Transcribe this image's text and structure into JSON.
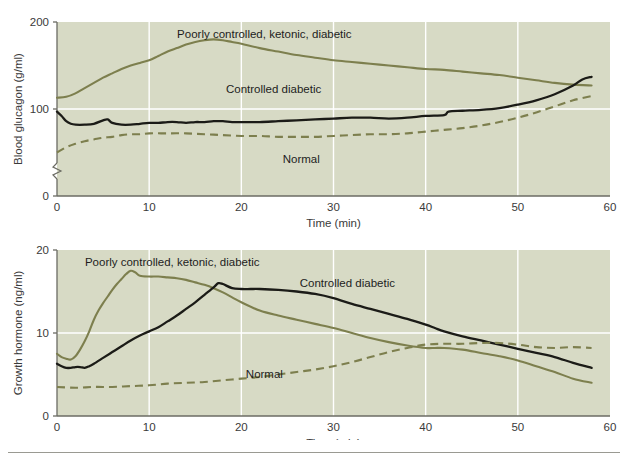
{
  "figure": {
    "caption_rule": "",
    "caption_text": ""
  },
  "chart_data": [
    {
      "id": "blood-glucagon",
      "type": "line",
      "title": "",
      "xlabel": "Time (min)",
      "ylabel": "Blood glucagon (g/ml)",
      "xlim": [
        0,
        60
      ],
      "ylim": [
        0,
        200
      ],
      "xticks": [
        0,
        10,
        20,
        30,
        40,
        50,
        60
      ],
      "xticklabels": [
        "0",
        "10",
        "20",
        "30",
        "40",
        "50",
        "60"
      ],
      "yticks": [
        0,
        100,
        200
      ],
      "yticklabels": [
        "0",
        "100",
        "200"
      ],
      "grid": true,
      "grid_color": "#ffffff",
      "plot_background": "#d7dac5",
      "legend": "inline-annotations",
      "axis_break_y": true,
      "series": [
        {
          "name": "Poorly controlled, ketonic, diabetic",
          "style": "solid",
          "color": "#7d7f4e",
          "label_position": {
            "x": 22.5,
            "y": 182
          },
          "x": [
            0,
            1,
            2,
            3,
            4,
            5,
            6,
            7,
            8,
            9,
            10,
            11,
            12,
            13,
            14,
            15,
            16,
            17,
            18,
            19,
            20,
            22,
            24,
            26,
            28,
            30,
            32,
            34,
            36,
            38,
            40,
            42,
            44,
            46,
            48,
            50,
            52,
            54,
            56,
            58
          ],
          "y": [
            113,
            114,
            118,
            124,
            130,
            136,
            141,
            146,
            150,
            153,
            156,
            161,
            166,
            170,
            174,
            177,
            179,
            180,
            179,
            177,
            175,
            170,
            166,
            162,
            159,
            156,
            154,
            152,
            150,
            148,
            146,
            145,
            143,
            141,
            139,
            136,
            133,
            130,
            128,
            127
          ]
        },
        {
          "name": "Controlled diabetic",
          "style": "solid",
          "color": "#1b1b17",
          "label_position": {
            "x": 23.5,
            "y": 118
          },
          "x": [
            0,
            0.5,
            1,
            1.5,
            2,
            3,
            4,
            5,
            5.5,
            6,
            7,
            8,
            9,
            10,
            11,
            12,
            13,
            14,
            15,
            16,
            17,
            18,
            19,
            20,
            22,
            24,
            26,
            28,
            30,
            32,
            34,
            36,
            38,
            40,
            42,
            42.5,
            44,
            46,
            48,
            50,
            52,
            54,
            56,
            57,
            58
          ],
          "y": [
            97,
            92,
            86,
            83,
            82,
            82,
            83,
            87,
            88,
            84,
            82,
            82,
            83,
            84,
            84,
            85,
            85,
            84,
            85,
            85,
            86,
            86,
            85,
            85,
            85,
            86,
            87,
            88,
            89,
            90,
            90,
            89,
            90,
            92,
            93,
            97,
            98,
            99,
            101,
            105,
            110,
            117,
            127,
            134,
            137
          ]
        },
        {
          "name": "Normal",
          "style": "dashed",
          "color": "#7d7f4e",
          "label_position": {
            "x": 26.5,
            "y": 38
          },
          "x": [
            0,
            1,
            2,
            3,
            4,
            5,
            6,
            7,
            8,
            9,
            10,
            12,
            14,
            16,
            18,
            20,
            22,
            24,
            26,
            28,
            30,
            32,
            34,
            36,
            38,
            40,
            42,
            44,
            46,
            48,
            50,
            52,
            54,
            56,
            58
          ],
          "y": [
            50,
            56,
            60,
            63,
            65,
            67,
            68,
            70,
            71,
            71,
            72,
            72,
            72,
            71,
            70,
            69,
            69,
            68,
            68,
            68,
            69,
            70,
            71,
            71,
            72,
            74,
            76,
            78,
            81,
            85,
            90,
            96,
            103,
            110,
            115
          ]
        }
      ]
    },
    {
      "id": "growth-hormone",
      "type": "line",
      "title": "",
      "xlabel": "Time (min)",
      "ylabel": "Growth hormone (ng/ml)",
      "xlim": [
        0,
        60
      ],
      "ylim": [
        0,
        20
      ],
      "xticks": [
        0,
        10,
        20,
        30,
        40,
        50,
        60
      ],
      "xticklabels": [
        "0",
        "10",
        "20",
        "30",
        "40",
        "50",
        "60"
      ],
      "yticks": [
        0,
        10,
        20
      ],
      "yticklabels": [
        "0",
        "10",
        "20"
      ],
      "grid": true,
      "grid_color": "#ffffff",
      "plot_background": "#d7dac5",
      "legend": "inline-annotations",
      "axis_break_y": false,
      "series": [
        {
          "name": "Poorly controlled, ketonic, diabetic",
          "style": "solid",
          "color": "#7d7f4e",
          "label_position": {
            "x": 12.5,
            "y": 18.1
          },
          "x": [
            0,
            0.5,
            1,
            1.5,
            2,
            2.5,
            3,
            3.5,
            4,
            4.5,
            5,
            5.5,
            6,
            6.5,
            7,
            7.5,
            8,
            8.5,
            9,
            10,
            11,
            12,
            13,
            14,
            15,
            16,
            17,
            18,
            19,
            20,
            22,
            24,
            26,
            28,
            30,
            32,
            34,
            36,
            38,
            40,
            41,
            42,
            44,
            46,
            48,
            50,
            52,
            54,
            56,
            58
          ],
          "y": [
            7.5,
            7.1,
            6.9,
            6.8,
            7.2,
            8.0,
            9.0,
            10.2,
            11.6,
            12.7,
            13.6,
            14.4,
            15.2,
            15.9,
            16.5,
            17.1,
            17.5,
            17.3,
            16.9,
            16.8,
            16.8,
            16.7,
            16.6,
            16.4,
            16.1,
            15.8,
            15.4,
            14.9,
            14.3,
            13.7,
            12.7,
            12.1,
            11.6,
            11.1,
            10.6,
            10.0,
            9.4,
            8.9,
            8.5,
            8.2,
            8.2,
            8.2,
            8.0,
            7.6,
            7.2,
            6.7,
            6.0,
            5.3,
            4.5,
            4.0
          ]
        },
        {
          "name": "Controlled diabetic",
          "style": "solid",
          "color": "#1b1b17",
          "label_position": {
            "x": 31.5,
            "y": 15.6
          },
          "x": [
            0,
            0.5,
            1,
            1.5,
            2,
            2.5,
            3,
            3.5,
            4,
            5,
            6,
            7,
            8,
            9,
            10,
            11,
            12,
            13,
            14,
            15,
            16,
            17,
            17.5,
            18,
            19,
            20,
            21,
            22,
            24,
            26,
            28,
            30,
            32,
            34,
            36,
            38,
            40,
            41,
            42,
            44,
            46,
            48,
            50,
            52,
            54,
            56,
            58
          ],
          "y": [
            6.3,
            6.0,
            5.8,
            5.8,
            5.9,
            5.9,
            5.8,
            6.0,
            6.3,
            7.0,
            7.7,
            8.4,
            9.1,
            9.7,
            10.2,
            10.7,
            11.4,
            12.1,
            12.9,
            13.7,
            14.6,
            15.5,
            16.0,
            15.9,
            15.4,
            15.3,
            15.3,
            15.3,
            15.2,
            15.0,
            14.7,
            14.2,
            13.5,
            12.9,
            12.3,
            11.7,
            11.0,
            10.6,
            10.2,
            9.6,
            9.1,
            8.6,
            8.1,
            7.6,
            7.1,
            6.4,
            5.8
          ]
        },
        {
          "name": "Normal",
          "style": "dashed",
          "color": "#7d7f4e",
          "label_position": {
            "x": 22.5,
            "y": 4.6
          },
          "x": [
            0,
            2,
            4,
            6,
            8,
            10,
            12,
            14,
            16,
            18,
            20,
            22,
            24,
            26,
            28,
            30,
            32,
            34,
            36,
            38,
            40,
            42,
            44,
            46,
            48,
            50,
            52,
            54,
            56,
            58
          ],
          "y": [
            3.5,
            3.4,
            3.5,
            3.5,
            3.6,
            3.7,
            3.9,
            4.0,
            4.1,
            4.3,
            4.5,
            4.7,
            5.0,
            5.3,
            5.6,
            6.0,
            6.5,
            7.1,
            7.7,
            8.2,
            8.6,
            8.7,
            8.7,
            8.8,
            8.8,
            8.6,
            8.3,
            8.2,
            8.3,
            8.2
          ]
        }
      ]
    }
  ]
}
